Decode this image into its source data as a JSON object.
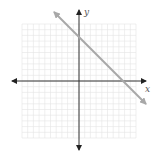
{
  "chart_data": {
    "type": "line",
    "title": "",
    "xlabel": "x",
    "ylabel": "y",
    "grid": true,
    "grid_squares": 20,
    "tick_labels": [],
    "series": [
      {
        "name": "line",
        "slope": -1,
        "approx_y_intercept": 7.7,
        "approx_x_intercept": 7.5,
        "note": "intercept estimated from gridlines; no tick labels shown",
        "arrows_both_ends": true,
        "color": "#a8a8a8"
      }
    ],
    "axes": {
      "x_label": "x",
      "y_label": "y",
      "arrows": "both ends",
      "color": "#333333"
    }
  },
  "labels": {
    "x_axis": "x",
    "y_axis": "y"
  }
}
